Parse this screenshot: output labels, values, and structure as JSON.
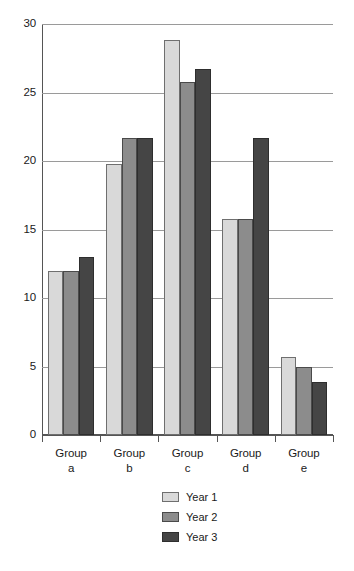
{
  "chart_data": {
    "type": "bar",
    "title": "",
    "subtitle": "",
    "xlabel": "",
    "ylabel": "",
    "ylim": [
      0,
      30
    ],
    "yticks": [
      0,
      5,
      10,
      15,
      20,
      25,
      30
    ],
    "ytick_labels": [
      "0",
      "5",
      "10",
      "15",
      "20",
      "25",
      "30"
    ],
    "grid": true,
    "legend_position": "bottom-center",
    "categories": [
      "Group a",
      "Group b",
      "Group c",
      "Group d",
      "Group e"
    ],
    "category_lines": [
      {
        "top": "Group",
        "bottom": "a"
      },
      {
        "top": "Group",
        "bottom": "b"
      },
      {
        "top": "Group",
        "bottom": "c"
      },
      {
        "top": "Group",
        "bottom": "d"
      },
      {
        "top": "Group",
        "bottom": "e"
      }
    ],
    "series": [
      {
        "name": "Year 1",
        "color": "#d9d9d9",
        "values": [
          12.0,
          19.8,
          28.8,
          15.8,
          5.7
        ]
      },
      {
        "name": "Year 2",
        "color": "#8c8c8c",
        "values": [
          12.0,
          21.7,
          25.8,
          15.8,
          5.0
        ]
      },
      {
        "name": "Year 3",
        "color": "#454545",
        "values": [
          13.0,
          21.7,
          26.7,
          21.7,
          3.9
        ]
      }
    ]
  },
  "legend": {
    "entries": [
      {
        "label": "Year 1"
      },
      {
        "label": "Year 2"
      },
      {
        "label": "Year 3"
      }
    ]
  },
  "colors": {
    "series_1": "#d9d9d9",
    "series_2": "#8c8c8c",
    "series_3": "#454545",
    "axis": "#555555",
    "gridline": "#9a9a9a",
    "text": "#1a1a1a",
    "background": "#ffffff"
  }
}
